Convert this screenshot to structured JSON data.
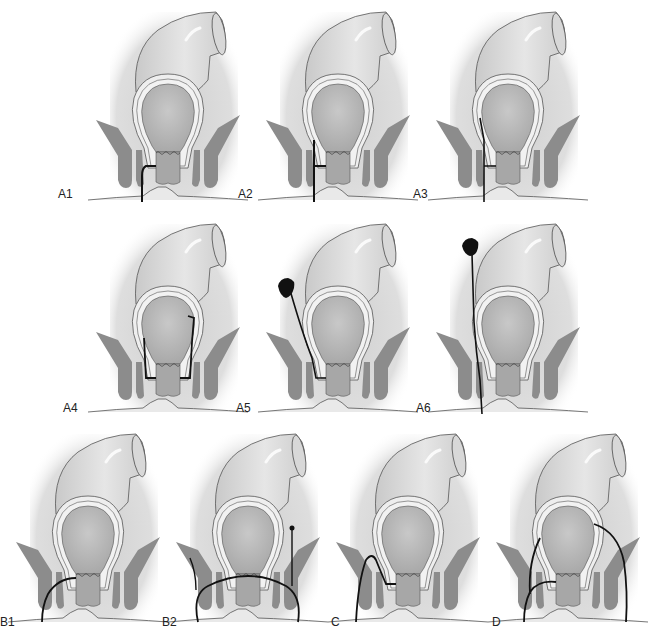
{
  "figure": {
    "colors": {
      "background": "#ffffff",
      "tissue_bg": "#dcdcdc",
      "colon": "#d4d4d4",
      "colon_highlight": "#ececec",
      "lumen": "#b9b9b9",
      "wall": "#e8e8e8",
      "muscle": "#8a8a8a",
      "outline": "#555555",
      "tract": "#111111"
    },
    "panels": [
      {
        "id": "A1",
        "label": "A1",
        "x": 88,
        "y": 0,
        "tract": "A1"
      },
      {
        "id": "A2",
        "label": "A2",
        "x": 258,
        "y": 0,
        "tract": "A2"
      },
      {
        "id": "A3",
        "label": "A3",
        "x": 428,
        "y": 0,
        "tract": "A3"
      },
      {
        "id": "A4",
        "label": "A4",
        "x": 88,
        "y": 212,
        "tract": "A4"
      },
      {
        "id": "A5",
        "label": "A5",
        "x": 258,
        "y": 212,
        "tract": "A5"
      },
      {
        "id": "A6",
        "label": "A6",
        "x": 428,
        "y": 212,
        "tract": "A6"
      },
      {
        "id": "B1",
        "label": "B1",
        "x": 8,
        "y": 422,
        "tract": "B1"
      },
      {
        "id": "B2",
        "label": "B2",
        "x": 168,
        "y": 422,
        "tract": "B2"
      },
      {
        "id": "C",
        "label": "C",
        "x": 328,
        "y": 422,
        "tract": "C"
      },
      {
        "id": "D",
        "label": "D",
        "x": 488,
        "y": 422,
        "tract": "D"
      }
    ],
    "labels": [
      {
        "text": "A1",
        "x": 58,
        "y": 188
      },
      {
        "text": "A2",
        "x": 238,
        "y": 188
      },
      {
        "text": "A3",
        "x": 413,
        "y": 188
      },
      {
        "text": "A4",
        "x": 63,
        "y": 402
      },
      {
        "text": "A5",
        "x": 236,
        "y": 402
      },
      {
        "text": "A6",
        "x": 416,
        "y": 402
      },
      {
        "text": "B1",
        "x": 0,
        "y": 616
      },
      {
        "text": "B2",
        "x": 162,
        "y": 616
      },
      {
        "text": "C",
        "x": 331,
        "y": 616
      },
      {
        "text": "D",
        "x": 492,
        "y": 616
      }
    ]
  }
}
